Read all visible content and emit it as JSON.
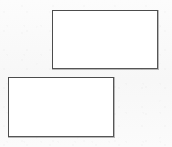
{
  "canvas": {
    "width": 172,
    "height": 147,
    "background_color": "#fafafa",
    "description": "Line drawing containing two empty offset rectangles"
  },
  "shapes": [
    {
      "name": "upper-rectangle",
      "type": "rectangle",
      "label": "",
      "fill_color": "#ffffff",
      "border_color": "#555555",
      "border_width_px": 1.5,
      "x": 52,
      "y": 10,
      "width": 106,
      "height": 59
    },
    {
      "name": "lower-rectangle",
      "type": "rectangle",
      "label": "",
      "fill_color": "#ffffff",
      "border_color": "#555555",
      "border_width_px": 1.5,
      "x": 8,
      "y": 77,
      "width": 106,
      "height": 60
    }
  ]
}
